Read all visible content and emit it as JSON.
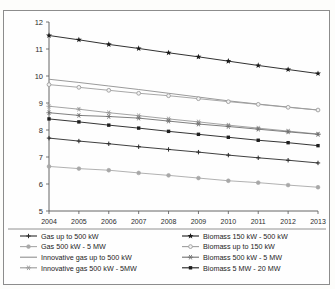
{
  "chart_data": {
    "type": "line",
    "title": "",
    "subtitle": "",
    "xlabel": "",
    "ylabel": "",
    "x": [
      2004,
      2005,
      2006,
      2007,
      2008,
      2009,
      2010,
      2011,
      2012,
      2013
    ],
    "categories": [
      "2004",
      "2005",
      "2006",
      "2007",
      "2008",
      "2009",
      "2010",
      "2011",
      "2012",
      "2013"
    ],
    "xlim": [
      2004,
      2013
    ],
    "ylim": [
      5,
      12
    ],
    "yticks": [
      5,
      6,
      7,
      8,
      9,
      10,
      11,
      12
    ],
    "ytick_labels": [
      "5",
      "6",
      "7",
      "8",
      "9",
      "10",
      "11",
      "12"
    ],
    "grid": false,
    "legend_position": "bottom",
    "series": [
      {
        "name": "Gas up to 500 kW",
        "marker": "plus",
        "color": "#2a2a2a",
        "values": [
          7.7,
          7.59,
          7.49,
          7.38,
          7.28,
          7.18,
          7.07,
          6.97,
          6.88,
          6.78
        ]
      },
      {
        "name": "Gas 500 kW - 5 MW",
        "marker": "circle",
        "color": "#a8a8a8",
        "values": [
          6.65,
          6.57,
          6.51,
          6.41,
          6.32,
          6.22,
          6.12,
          6.05,
          5.96,
          5.88
        ]
      },
      {
        "name": "Innovative gas up to 500 kW",
        "marker": "none",
        "color": "#8f8f8f",
        "values": [
          9.88,
          9.76,
          9.63,
          9.5,
          9.36,
          9.22,
          9.08,
          8.96,
          8.85,
          8.74
        ]
      },
      {
        "name": "Innovative gas 500 kW - 5MW",
        "marker": "asterisk",
        "color": "#9a9a9a",
        "values": [
          8.88,
          8.77,
          8.64,
          8.53,
          8.41,
          8.3,
          8.18,
          8.07,
          7.96,
          7.85
        ]
      },
      {
        "name": "Biomass 150 kW - 500 kW",
        "marker": "star",
        "color": "#1a1a1a",
        "values": [
          11.5,
          11.34,
          11.17,
          11.02,
          10.86,
          10.71,
          10.55,
          10.39,
          10.24,
          10.09
        ]
      },
      {
        "name": "Biomass up to 150 kW",
        "marker": "circle-open",
        "color": "#9d9d9d",
        "values": [
          9.68,
          9.58,
          9.47,
          9.36,
          9.27,
          9.16,
          9.05,
          8.95,
          8.84,
          8.74
        ]
      },
      {
        "name": "Biomass 500 kW - 5 MW",
        "marker": "asterisk",
        "color": "#707070",
        "values": [
          8.64,
          8.54,
          8.5,
          8.44,
          8.33,
          8.22,
          8.13,
          8.03,
          7.93,
          7.84
        ]
      },
      {
        "name": "Biomass 5 MW - 20 MW",
        "marker": "square",
        "color": "#1f1f1f",
        "values": [
          8.41,
          8.3,
          8.18,
          8.07,
          7.95,
          7.84,
          7.73,
          7.62,
          7.53,
          7.42
        ]
      }
    ]
  },
  "legend": {
    "columns": [
      {
        "entries": [
          {
            "label": "Gas up to 500 kW",
            "series_index": 0
          },
          {
            "label": "Gas 500 kW - 5 MW",
            "series_index": 1
          },
          {
            "label": "Innovative gas up to 500 kW",
            "series_index": 2
          },
          {
            "label": "Innovative gas 500 kW - 5MW",
            "series_index": 3
          }
        ]
      },
      {
        "entries": [
          {
            "label": "Biomass 150 kW - 500 kW",
            "series_index": 4
          },
          {
            "label": "Biomass  up to 150 kW",
            "series_index": 5
          },
          {
            "label": "Biomass 500 kW - 5 MW",
            "series_index": 6
          },
          {
            "label": "Biomass 5 MW - 20 MW",
            "series_index": 7
          }
        ]
      }
    ]
  },
  "colors": {
    "frame": "#8c8c8c",
    "axis": "#555555",
    "background": "#fefefe",
    "text": "#1c1c1c"
  }
}
